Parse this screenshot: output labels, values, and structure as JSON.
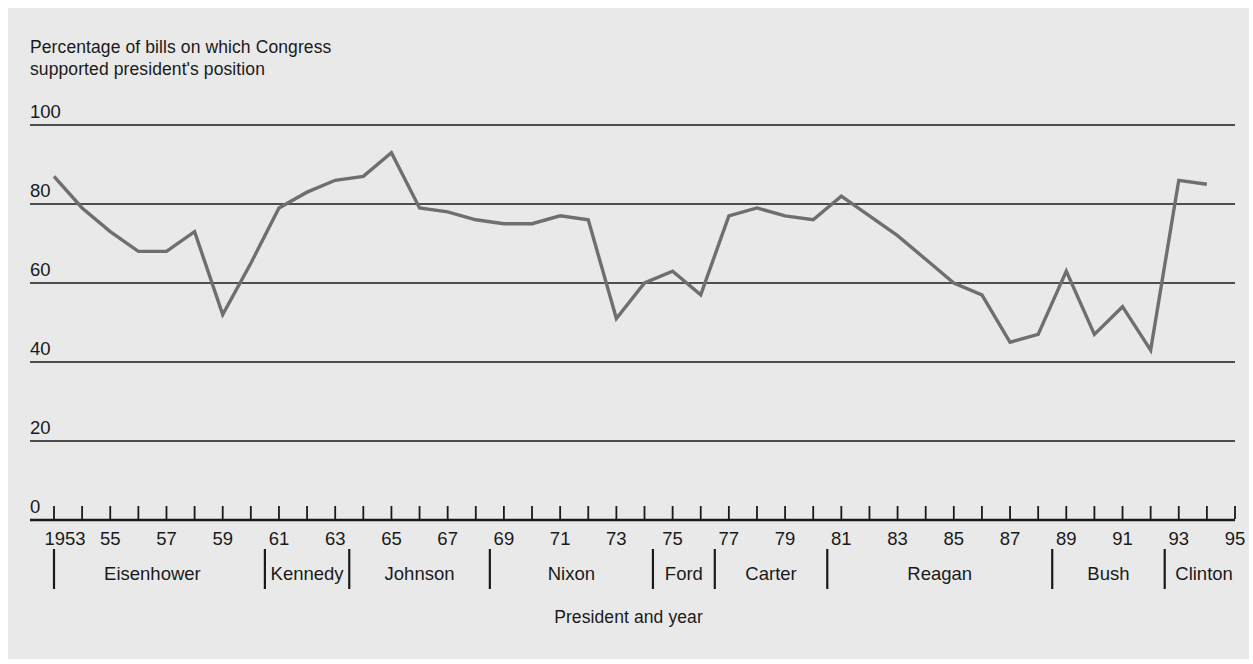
{
  "chart_data": {
    "type": "line",
    "title": "",
    "ylabel": "Percentage of bills on which Congress\nsupported president's position",
    "xlabel": "President and year",
    "ylim": [
      0,
      100
    ],
    "yticks": [
      0,
      20,
      40,
      60,
      80,
      100
    ],
    "ytick_labels": [
      "0",
      "20",
      "40",
      "60",
      "80",
      "100"
    ],
    "grid": "horizontal",
    "legend_position": "none",
    "line_color": "#6f6f6f",
    "xlim": [
      1953,
      1995
    ],
    "x": [
      1953,
      1954,
      1955,
      1956,
      1957,
      1958,
      1959,
      1960,
      1961,
      1962,
      1963,
      1964,
      1965,
      1966,
      1967,
      1968,
      1969,
      1970,
      1971,
      1972,
      1973,
      1974,
      1975,
      1976,
      1977,
      1978,
      1979,
      1980,
      1981,
      1982,
      1983,
      1984,
      1985,
      1986,
      1987,
      1988,
      1989,
      1990,
      1991,
      1992,
      1993,
      1994
    ],
    "values": [
      87,
      79,
      73,
      68,
      68,
      73,
      52,
      65,
      79,
      83,
      86,
      87,
      93,
      79,
      78,
      76,
      75,
      75,
      77,
      76,
      51,
      60,
      63,
      57,
      77,
      79,
      77,
      76,
      82,
      77,
      72,
      66,
      60,
      57,
      45,
      47,
      63,
      47,
      54,
      43,
      86,
      85
    ],
    "xtick_labels": [
      "1953",
      "55",
      "57",
      "59",
      "61",
      "63",
      "65",
      "67",
      "69",
      "71",
      "73",
      "75",
      "77",
      "79",
      "81",
      "83",
      "85",
      "87",
      "89",
      "91",
      "93",
      "95"
    ],
    "xtick_years": [
      1953,
      1955,
      1957,
      1959,
      1961,
      1963,
      1965,
      1967,
      1969,
      1971,
      1973,
      1975,
      1977,
      1979,
      1981,
      1983,
      1985,
      1987,
      1989,
      1991,
      1993,
      1995
    ],
    "minor_tick_years": [
      1953,
      1954,
      1955,
      1956,
      1957,
      1958,
      1959,
      1960,
      1961,
      1962,
      1963,
      1964,
      1965,
      1966,
      1967,
      1968,
      1969,
      1970,
      1971,
      1972,
      1973,
      1974,
      1975,
      1976,
      1977,
      1978,
      1979,
      1980,
      1981,
      1982,
      1983,
      1984,
      1985,
      1986,
      1987,
      1988,
      1989,
      1990,
      1991,
      1992,
      1993,
      1994,
      1995
    ],
    "presidents": [
      {
        "name": "Eisenhower",
        "start": 1953,
        "end": 1960.5,
        "center": 1956.5
      },
      {
        "name": "Kennedy",
        "start": 1960.5,
        "end": 1963.5,
        "center": 1962.0
      },
      {
        "name": "Johnson",
        "start": 1963.5,
        "end": 1968.5,
        "center": 1966.0
      },
      {
        "name": "Nixon",
        "start": 1968.5,
        "end": 1974.3,
        "center": 1971.4
      },
      {
        "name": "Ford",
        "start": 1974.3,
        "end": 1976.5,
        "center": 1975.4
      },
      {
        "name": "Carter",
        "start": 1976.5,
        "end": 1980.5,
        "center": 1978.5
      },
      {
        "name": "Reagan",
        "start": 1980.5,
        "end": 1988.5,
        "center": 1984.5
      },
      {
        "name": "Bush",
        "start": 1988.5,
        "end": 1992.5,
        "center": 1990.5
      },
      {
        "name": "Clinton",
        "start": 1992.5,
        "end": 1995.0,
        "center": 1993.9
      }
    ],
    "divider_years": [
      1953,
      1960.5,
      1963.5,
      1968.5,
      1974.3,
      1976.5,
      1980.5,
      1988.5,
      1992.5
    ]
  },
  "figure": {
    "background_color": "#e9e9e9",
    "text_color": "#1a1a1a",
    "axis_color": "#1a1a1a"
  }
}
